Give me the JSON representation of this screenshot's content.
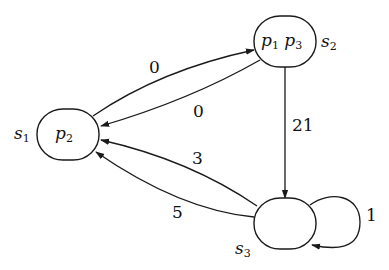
{
  "diagram": {
    "type": "state-transition-graph",
    "nodes": [
      {
        "id": "s1",
        "name": "s",
        "name_sub": "1",
        "props": [
          {
            "p": "p",
            "sub": "2"
          }
        ]
      },
      {
        "id": "s2",
        "name": "s",
        "name_sub": "2",
        "props": [
          {
            "p": "p",
            "sub": "1"
          },
          {
            "p": "p",
            "sub": "3"
          }
        ]
      },
      {
        "id": "s3",
        "name": "s",
        "name_sub": "3",
        "props": []
      }
    ],
    "edges": [
      {
        "from": "s1",
        "to": "s2",
        "label": "0"
      },
      {
        "from": "s2",
        "to": "s1",
        "label": "0"
      },
      {
        "from": "s2",
        "to": "s3",
        "label": "21"
      },
      {
        "from": "s3",
        "to": "s1",
        "label": "3"
      },
      {
        "from": "s3",
        "to": "s1",
        "label": "5"
      },
      {
        "from": "s3",
        "to": "s3",
        "label": "1"
      }
    ]
  }
}
